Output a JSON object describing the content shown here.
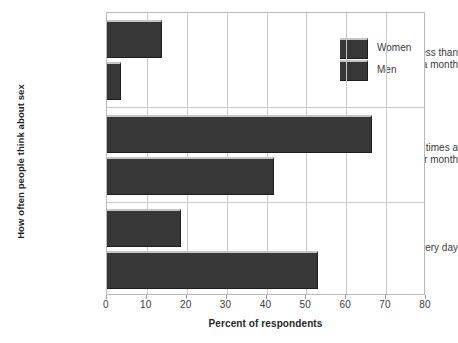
{
  "chart_data": {
    "type": "bar",
    "orientation": "horizontal",
    "title": "",
    "xlabel": "Percent of respondents",
    "ylabel": "How often people think about sex",
    "categories": [
      "Less than once a month",
      "Few times a week or month",
      "Every day"
    ],
    "category_lines": [
      [
        "Less than",
        "once a month"
      ],
      [
        "Few times a",
        "week or month"
      ],
      [
        "Every day"
      ]
    ],
    "series": [
      {
        "name": "Women",
        "values": [
          13.8,
          66.5,
          18.5
        ],
        "color": "#373737"
      },
      {
        "name": "Men",
        "values": [
          3.5,
          42.0,
          53.0
        ],
        "color": "#373737"
      }
    ],
    "xlim": [
      0,
      80
    ],
    "xticks": [
      0,
      10,
      20,
      30,
      40,
      50,
      60,
      70,
      80
    ],
    "xtick_labels": [
      "0",
      "10",
      "20",
      "30",
      "40",
      "50",
      "60",
      "70",
      "80"
    ],
    "grid": true,
    "grid_axis": "both",
    "legend": {
      "position": "top-right-inside",
      "entries": [
        "Women",
        "Men"
      ]
    }
  },
  "legend": {
    "items": [
      {
        "label": "Women"
      },
      {
        "label": "Men"
      }
    ]
  },
  "axes": {
    "x_title": "Percent of respondents",
    "y_title": "How often people think about sex"
  },
  "colors": {
    "bar_fill": "#373737",
    "bar_highlight": "#c5c5c5",
    "bar_shadow": "#1d1d1d",
    "gridline": "#c9c9c9",
    "frame": "#b9b9b9",
    "text": "#3b3b3b",
    "background": "#ffffff"
  }
}
